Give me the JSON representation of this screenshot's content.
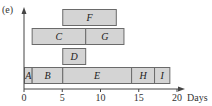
{
  "panel_label": "(e)",
  "chart_data": {
    "type": "gantt",
    "title": "",
    "xlabel": "Days",
    "ylabel": "",
    "xlim": [
      0,
      21
    ],
    "xticks": [
      0,
      5,
      10,
      15,
      20
    ],
    "tick_labels": [
      "0",
      "5",
      "10",
      "15",
      "20"
    ],
    "grid": false,
    "legend": null,
    "rows": [
      {
        "row": 0,
        "tasks": [
          {
            "name": "A",
            "start": 0,
            "end": 1
          },
          {
            "name": "B",
            "start": 1,
            "end": 5
          },
          {
            "name": "E",
            "start": 5,
            "end": 14
          },
          {
            "name": "H",
            "start": 14,
            "end": 17
          },
          {
            "name": "I",
            "start": 17,
            "end": 19
          }
        ]
      },
      {
        "row": 1,
        "tasks": [
          {
            "name": "D",
            "start": 5,
            "end": 8
          }
        ]
      },
      {
        "row": 2,
        "tasks": [
          {
            "name": "C",
            "start": 1,
            "end": 8
          },
          {
            "name": "G",
            "start": 8,
            "end": 13
          }
        ]
      },
      {
        "row": 3,
        "tasks": [
          {
            "name": "F",
            "start": 5,
            "end": 12
          }
        ]
      }
    ]
  },
  "colors": {
    "bar_fill": "#d4d4d4",
    "bar_stroke": "#6a6a6a",
    "axis": "#444444"
  }
}
